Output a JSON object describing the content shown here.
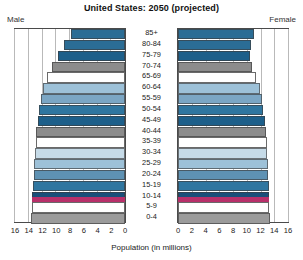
{
  "chart_data": {
    "type": "bar",
    "subtype": "population-pyramid",
    "title": "United States: 2050 (projected)",
    "xlabel": "Population (in millions)",
    "ylabel": "",
    "left_label": "Male",
    "right_label": "Female",
    "xlim": [
      0,
      16
    ],
    "x_ticks_left": [
      "16",
      "14",
      "12",
      "10",
      "8",
      "6",
      "4",
      "2",
      "0"
    ],
    "x_ticks_right": [
      "0",
      "2",
      "4",
      "6",
      "8",
      "10",
      "12",
      "14",
      "16"
    ],
    "grid": true,
    "legend": "none",
    "categories": [
      "85+",
      "80-84",
      "75-79",
      "70-74",
      "65-69",
      "60-64",
      "55-59",
      "50-54",
      "45-49",
      "40-44",
      "35-39",
      "30-34",
      "25-29",
      "20-24",
      "15-19",
      "10-14",
      "5-9",
      "0-4"
    ],
    "series": [
      {
        "name": "Male",
        "values": [
          7.8,
          8.9,
          9.7,
          10.6,
          11.3,
          11.9,
          12.2,
          12.5,
          12.7,
          12.9,
          13.0,
          13.1,
          13.2,
          13.3,
          13.4,
          13.5,
          13.6,
          13.7
        ]
      },
      {
        "name": "Female",
        "values": [
          11.0,
          10.6,
          10.4,
          10.8,
          11.4,
          11.9,
          12.2,
          12.4,
          12.6,
          12.8,
          12.9,
          13.0,
          13.1,
          13.1,
          13.2,
          13.3,
          13.3,
          13.4
        ]
      }
    ],
    "bar_colors": [
      "#2b6d95",
      "#2b6d95",
      "#1d5f8a",
      "#8c8c8c",
      "#ffffff",
      "#9dc1d8",
      "#7ba6c4",
      "#2f76a0",
      "#1d5f8a",
      "#8c8c8c",
      "#ffffff",
      "#c6dbe8",
      "#9dc1d8",
      "#5e92b4",
      "#2f76a0",
      "#1a4f7a",
      "#ffffff",
      "#9b9b9b"
    ],
    "accent_colors": {
      "steel_blue": "#2b6d95",
      "dark_navy": "#1a4f7a",
      "gray": "#8c8c8c",
      "light_blue": "#9dc1d8",
      "magenta_stripe": "#b8306a",
      "frame": "#4a4a4a",
      "gridline": "#b9b9b9"
    },
    "magenta_stripe_category": "10-14"
  }
}
